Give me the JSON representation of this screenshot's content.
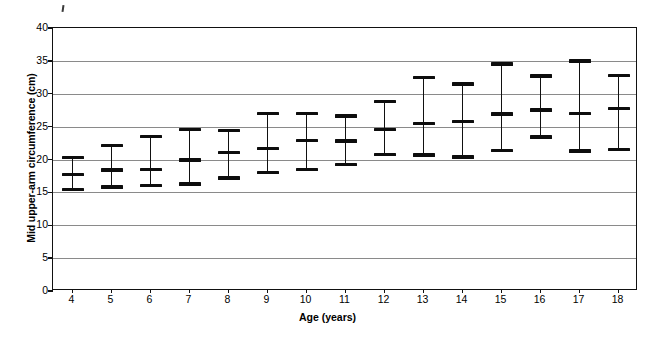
{
  "figure": {
    "background_color": "#ffffff",
    "ink_color": "#000000",
    "gridline_color": "#8a8a8a"
  },
  "chart_data": {
    "type": "scatter",
    "title": "",
    "subtitle": "",
    "xlabel": "Age (years)",
    "ylabel": "Mid upper-arm circumference (cm)",
    "xlim": [
      3.5,
      18.5
    ],
    "ylim": [
      0,
      40
    ],
    "ytick_step": 5,
    "yticks": [
      0,
      5,
      10,
      15,
      20,
      25,
      30,
      35,
      40
    ],
    "ytick_labels": [
      "0",
      "5",
      "10",
      "15",
      "20",
      "25",
      "30",
      "35",
      "40"
    ],
    "grid": true,
    "grid_axis": "y",
    "legend": false,
    "legend_position": "none",
    "marker_style": "horizontal-bar-caps-with-vertical-whisker",
    "categories": [
      4,
      5,
      6,
      7,
      8,
      9,
      10,
      11,
      12,
      13,
      14,
      15,
      16,
      17,
      18
    ],
    "xtick_labels": [
      "4",
      "5",
      "6",
      "7",
      "8",
      "9",
      "10",
      "11",
      "12",
      "13",
      "14",
      "15",
      "16",
      "17",
      "18"
    ],
    "series": [
      {
        "name": "Upper reference limit",
        "values": [
          20.3,
          22.1,
          23.5,
          24.6,
          24.4,
          27.0,
          27.0,
          26.6,
          28.8,
          32.5,
          31.5,
          34.5,
          32.7,
          35.0,
          32.8
        ]
      },
      {
        "name": "Median",
        "values": [
          17.7,
          18.4,
          18.5,
          19.9,
          21.1,
          21.7,
          22.9,
          22.8,
          24.6,
          25.5,
          25.8,
          26.9,
          27.5,
          27.0,
          27.8
        ]
      },
      {
        "name": "Lower reference limit",
        "values": [
          15.4,
          15.8,
          16.0,
          16.3,
          17.2,
          18.0,
          18.5,
          19.2,
          20.8,
          20.7,
          20.4,
          21.4,
          23.4,
          21.3,
          21.5
        ]
      }
    ]
  }
}
